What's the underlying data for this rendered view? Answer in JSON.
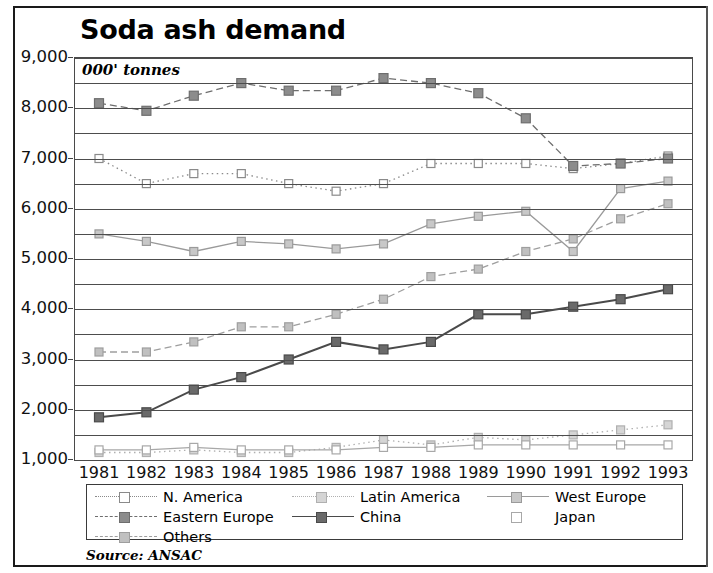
{
  "title": "Soda ash demand",
  "units_label": "000' tonnes",
  "source": "Source: ANSAC",
  "chart_data": {
    "type": "line",
    "title": "Soda ash demand",
    "xlabel": "",
    "ylabel": "000' tonnes",
    "ylim": [
      1000,
      9000
    ],
    "ytick_step": 1000,
    "gridline_step": 500,
    "grid": true,
    "legend_position": "bottom",
    "ytick_labels": [
      "9,000",
      "8,000",
      "7,000",
      "6,000",
      "5,000",
      "4,000",
      "3,000",
      "2,000",
      "1,000"
    ],
    "categories": [
      1981,
      1982,
      1983,
      1984,
      1985,
      1986,
      1987,
      1988,
      1989,
      1990,
      1991,
      1992,
      1993
    ],
    "xtick_labels": [
      "1981",
      "1982",
      "1983",
      "1984",
      "1985",
      "1986",
      "1987",
      "1988",
      "1989",
      "1990",
      "1991",
      "1992",
      "1993"
    ],
    "series": [
      {
        "name": "N. America",
        "color": "#8a8a8a",
        "marker_fill": "#ffffff",
        "line_style": "dotted",
        "values": [
          7000,
          6500,
          6700,
          6700,
          6500,
          6350,
          6500,
          6900,
          6900,
          6900,
          6800,
          6900,
          7050
        ]
      },
      {
        "name": "Latin America",
        "color": "#b0b0b0",
        "marker_fill": "#d5d5d5",
        "line_style": "dotted",
        "values": [
          1150,
          1150,
          1200,
          1150,
          1150,
          1250,
          1400,
          1300,
          1450,
          1400,
          1500,
          1600,
          1700
        ]
      },
      {
        "name": "West Europe",
        "color": "#9a9a9a",
        "marker_fill": "#c8c8c8",
        "line_style": "solid",
        "values": [
          5500,
          5350,
          5150,
          5350,
          5300,
          5200,
          5300,
          5700,
          5850,
          5950,
          5150,
          6400,
          6550
        ]
      },
      {
        "name": "Eastern Europe",
        "color": "#6e6e6e",
        "marker_fill": "#8c8c8c",
        "line_style": "dashed",
        "values": [
          8100,
          7950,
          8250,
          8500,
          8350,
          8350,
          8600,
          8500,
          8300,
          7800,
          6850,
          6900,
          7000
        ]
      },
      {
        "name": "China",
        "color": "#4a4a4a",
        "marker_fill": "#6a6a6a",
        "line_style": "solid",
        "values": [
          1850,
          1950,
          2400,
          2650,
          3000,
          3350,
          3200,
          3350,
          3900,
          3900,
          4050,
          4200,
          4400
        ]
      },
      {
        "name": "Japan",
        "color": "#a8a8a8",
        "marker_fill": "#ffffff",
        "line_style": "solid",
        "values": [
          1200,
          1200,
          1250,
          1200,
          1200,
          1200,
          1250,
          1250,
          1300,
          1300,
          1300,
          1300,
          1300
        ]
      },
      {
        "name": "Others",
        "color": "#9e9e9e",
        "marker_fill": "#c0c0c0",
        "line_style": "dashed",
        "values": [
          3150,
          3150,
          3350,
          3650,
          3650,
          3900,
          4200,
          4650,
          4800,
          5150,
          5400,
          5800,
          6100
        ]
      }
    ]
  },
  "legend": {
    "items": [
      {
        "label": "N. America"
      },
      {
        "label": "Latin America"
      },
      {
        "label": "West Europe"
      },
      {
        "label": "Eastern Europe"
      },
      {
        "label": "China"
      },
      {
        "label": "Japan"
      },
      {
        "label": "Others"
      }
    ]
  }
}
